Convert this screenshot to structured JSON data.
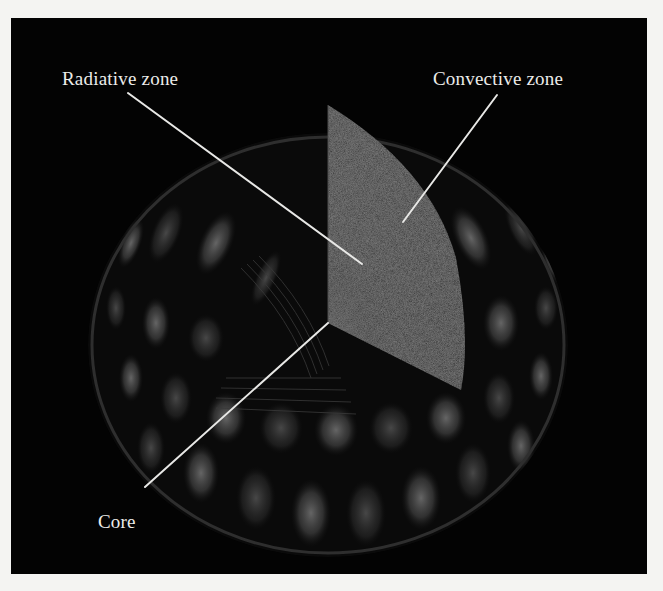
{
  "figure": {
    "background_color": "#f4f4f2",
    "panel_color": "#030303",
    "label_color": "#ececea",
    "leader_line_color": "#e8e8e6"
  },
  "labels": {
    "radiative_zone": "Radiative zone",
    "convective_zone": "Convective zone",
    "core": "Core"
  },
  "leader_lines": {
    "radiative_zone": {
      "x1": 117,
      "y1": 75,
      "x2": 351,
      "y2": 246
    },
    "convective_zone": {
      "x1": 486,
      "y1": 77,
      "x2": 392,
      "y2": 204
    },
    "core": {
      "x1": 134,
      "y1": 469,
      "x2": 317,
      "y2": 305
    }
  }
}
